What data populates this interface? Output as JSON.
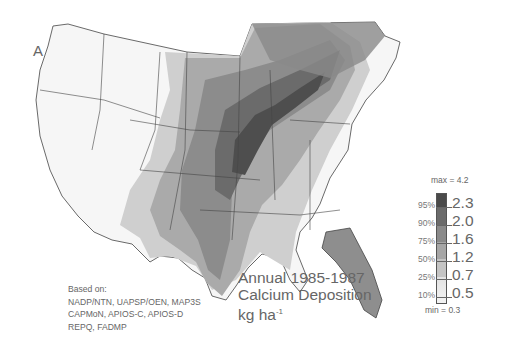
{
  "panel_label": "A",
  "title": {
    "line1": "Annual 1985-1987",
    "line2": "Calcium Deposition",
    "unit": "kg ha",
    "unit_exp": "-1"
  },
  "source": {
    "heading": "Based on:",
    "lines": [
      "NADP/NTN, UAPSP/OEN, MAP3S",
      "CAPMoN, APIOS-C, APIOS-D",
      "REPQ, FADMP"
    ]
  },
  "legend": {
    "max_label": "max = 4.2",
    "min_label": "min = 0.3",
    "classes": [
      {
        "percentile": "95%",
        "value": "2.3",
        "color": "#4a4a4a"
      },
      {
        "percentile": "90%",
        "value": "2.0",
        "color": "#6b6b6b"
      },
      {
        "percentile": "75%",
        "value": "1.6",
        "color": "#8a8a8a"
      },
      {
        "percentile": "50%",
        "value": "1.2",
        "color": "#a6a6a6"
      },
      {
        "percentile": "25%",
        "value": "0.7",
        "color": "#c4c4c4"
      },
      {
        "percentile": "10%",
        "value": "0.5",
        "color": "#e2e2e2"
      }
    ]
  },
  "map": {
    "region": "Contiguous United States and southeastern Canada",
    "pattern": "Highest deposition in a band from Texas/Oklahoma through the Midwest and Great Lakes to the St. Lawrence valley; lowest along the West and Atlantic coasts"
  }
}
